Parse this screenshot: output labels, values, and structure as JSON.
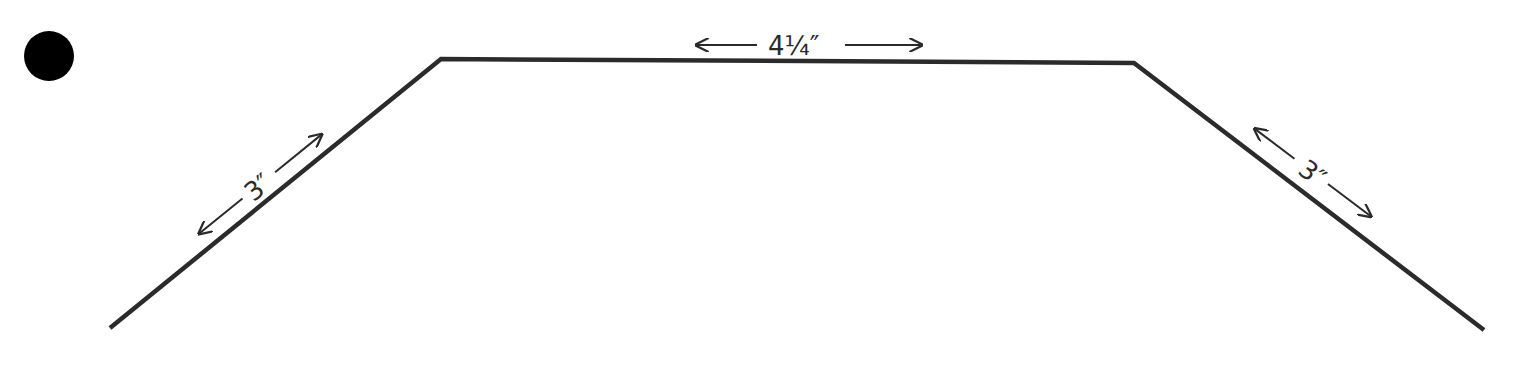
{
  "diagram": {
    "type": "trapezoid-template",
    "bullet_marker": {
      "shape": "filled-circle",
      "color": "#000000"
    },
    "line_color": "#2b2b2b",
    "segments": {
      "left": {
        "label": "3″"
      },
      "top": {
        "label": "4¼″"
      },
      "right": {
        "label": "3″"
      }
    }
  }
}
